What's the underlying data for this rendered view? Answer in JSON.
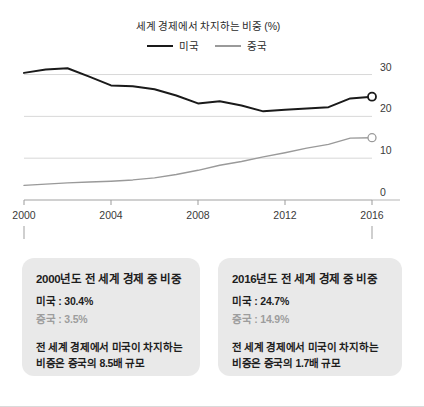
{
  "chart_data": {
    "type": "line",
    "title": "세계 경제에서 차지하는 비중 (%)",
    "xlabel": "",
    "ylabel": "",
    "ylim": [
      0,
      33
    ],
    "xlim": [
      2000,
      2016
    ],
    "grid": true,
    "y_axis_position": "right",
    "legend_position": "top-center",
    "yticks": [
      "30",
      "20",
      "10",
      "0"
    ],
    "ytick_values": [
      30,
      20,
      10,
      0
    ],
    "xticks": [
      "2000",
      "2004",
      "2008",
      "2012",
      "2016"
    ],
    "xtick_values": [
      2000,
      2004,
      2008,
      2012,
      2016
    ],
    "x": [
      2000,
      2001,
      2002,
      2003,
      2004,
      2005,
      2006,
      2007,
      2008,
      2009,
      2010,
      2011,
      2012,
      2013,
      2014,
      2015,
      2016
    ],
    "series": [
      {
        "name": "미국",
        "color": "#1a1a1a",
        "endpoint_marker": true,
        "values": [
          30.4,
          31.2,
          31.5,
          29.5,
          27.4,
          27.2,
          26.5,
          25.0,
          23.1,
          23.6,
          22.6,
          21.2,
          21.6,
          21.9,
          22.2,
          24.3,
          24.7
        ]
      },
      {
        "name": "중국",
        "color": "#9a9a9a",
        "endpoint_marker": true,
        "values": [
          3.5,
          3.8,
          4.1,
          4.3,
          4.5,
          4.8,
          5.3,
          6.1,
          7.1,
          8.3,
          9.2,
          10.3,
          11.3,
          12.4,
          13.3,
          14.8,
          14.9
        ]
      }
    ]
  },
  "legend": {
    "title": "세계 경제에서 차지하는 비중 (%)",
    "items": [
      {
        "label": "미국",
        "color": "#1a1a1a"
      },
      {
        "label": "중국",
        "color": "#9a9a9a"
      }
    ]
  },
  "callouts": [
    {
      "title": "2000년도 전 세계 경제 중 비중",
      "us_stat": "미국 : 30.4%",
      "cn_stat": "중국 : 3.5%",
      "note_line1": "전 세계 경제에서 미국이 차지하는",
      "note_line2": "비중은 중국의 8.5배 규모",
      "anchor_year": "2000"
    },
    {
      "title": "2016년도 전 세계 경제 중 비중",
      "us_stat": "미국 : 24.7%",
      "cn_stat": "중국 : 14.9%",
      "note_line1": "전 세계 경제에서 미국이 차지하는",
      "note_line2": "비중은 중국의 1.7배 규모",
      "anchor_year": "2016"
    }
  ],
  "colors": {
    "us_line": "#1a1a1a",
    "cn_line": "#9a9a9a",
    "gridline": "#d8d8d8",
    "callout_bg": "#e9e9e9",
    "background": "#ffffff"
  }
}
